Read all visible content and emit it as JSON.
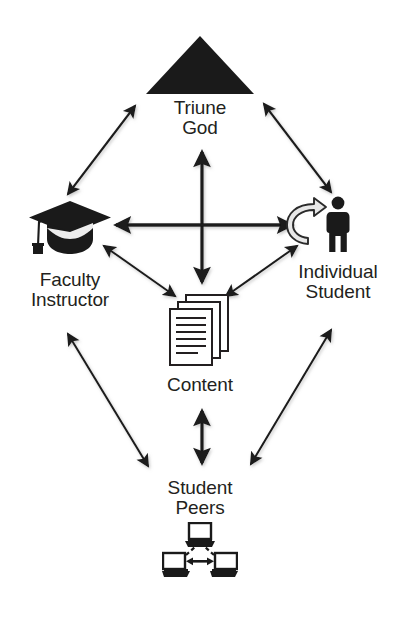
{
  "diagram": {
    "background_color": "#ffffff",
    "ink_color": "#231f20",
    "nodes": [
      {
        "id": "triune-god",
        "label": "Triune\nGod",
        "icon": "black-triangle-icon",
        "icon_color": "#1a1a1a"
      },
      {
        "id": "faculty-instructor",
        "label": "Faculty\nInstructor",
        "icon": "graduation-cap-icon",
        "icon_color": "#1a1a1a"
      },
      {
        "id": "individual-student",
        "label": "Individual\nStudent",
        "icon": "person-with-self-reflection-arrows-icon",
        "icon_color": "#1a1a1a"
      },
      {
        "id": "content",
        "label": "Content",
        "icon": "stacked-documents-icon",
        "icon_color": "#231f20"
      },
      {
        "id": "student-peers",
        "label": "Student\nPeers",
        "icon": "networked-computers-icon",
        "icon_color": "#1a1a1a"
      }
    ],
    "edges": [
      {
        "id": "faculty-to-god",
        "from": "faculty-instructor",
        "to": "triune-god",
        "style": "double-headed-arrow"
      },
      {
        "id": "student-to-god",
        "from": "individual-student",
        "to": "triune-god",
        "style": "double-headed-arrow"
      },
      {
        "id": "god-to-content",
        "from": "triune-god",
        "to": "content",
        "style": "double-headed-arrow-thick"
      },
      {
        "id": "faculty-to-student",
        "from": "faculty-instructor",
        "to": "individual-student",
        "style": "double-headed-arrow-thick"
      },
      {
        "id": "faculty-to-content",
        "from": "faculty-instructor",
        "to": "content",
        "style": "double-headed-arrow"
      },
      {
        "id": "student-to-content",
        "from": "individual-student",
        "to": "content",
        "style": "double-headed-arrow"
      },
      {
        "id": "faculty-to-peers",
        "from": "faculty-instructor",
        "to": "student-peers",
        "style": "double-headed-arrow"
      },
      {
        "id": "student-to-peers",
        "from": "individual-student",
        "to": "student-peers",
        "style": "double-headed-arrow"
      },
      {
        "id": "content-to-peers",
        "from": "content",
        "to": "student-peers",
        "style": "double-headed-arrow-thick"
      }
    ]
  }
}
